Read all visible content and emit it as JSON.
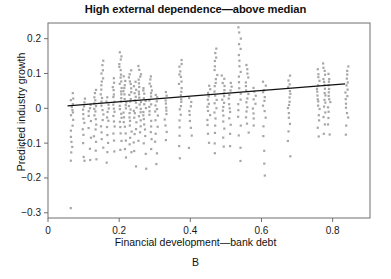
{
  "figure": {
    "title": "High external dependence—above median",
    "panel_label": "B",
    "xlabel": "Financial development—bank debt",
    "ylabel": "Predicted industry growth"
  },
  "chart_data": {
    "type": "scatter",
    "title": "High external dependence—above median",
    "xlabel": "Financial development—bank debt",
    "ylabel": "Predicted industry growth",
    "panel_label": "B",
    "xlim": [
      0.0,
      0.905
    ],
    "ylim": [
      -0.315,
      0.245
    ],
    "xticks": [
      0,
      0.2,
      0.4,
      0.6,
      0.8
    ],
    "xticklabels": [
      "0",
      "0.2",
      "0.4",
      "0.6",
      "0.8"
    ],
    "yticks": [
      0.2,
      0.1,
      0,
      -0.1,
      -0.2,
      -0.3
    ],
    "yticklabels": [
      "0.2",
      "0.1",
      "0",
      "−0.1",
      "−0.2",
      "−0.3"
    ],
    "grid": false,
    "legend": null,
    "marker_color": "#9a9a9a",
    "marker_size": 2.2,
    "fit_line": {
      "color": "#111111",
      "width": 1.2,
      "x_start": 0.055,
      "y_start": 0.007,
      "x_end": 0.835,
      "y_end": 0.07,
      "slope": 0.081,
      "intercept": 0.0025
    },
    "columns": [
      {
        "x": 0.068,
        "values": [
          0.045,
          0.03,
          0.022,
          0.012,
          0.004,
          -0.004,
          -0.012,
          -0.022,
          -0.034,
          -0.05,
          -0.065,
          -0.08,
          -0.095,
          -0.11,
          -0.126,
          -0.152,
          -0.288
        ]
      },
      {
        "x": 0.1,
        "values": [
          0.03,
          0.018,
          0.006,
          -0.004,
          -0.016,
          -0.028,
          -0.042,
          -0.058,
          -0.076,
          -0.1,
          -0.14,
          -0.152
        ]
      },
      {
        "x": 0.118,
        "values": [
          0.012,
          0.002,
          -0.01,
          -0.022,
          -0.038,
          -0.058,
          -0.085,
          -0.118,
          -0.15
        ]
      },
      {
        "x": 0.133,
        "values": [
          0.055,
          0.042,
          0.032,
          0.022,
          0.014,
          0.006,
          -0.002,
          -0.01,
          -0.02,
          -0.032,
          -0.046,
          -0.062,
          -0.08,
          -0.098,
          -0.12,
          -0.145
        ]
      },
      {
        "x": 0.152,
        "values": [
          0.135,
          0.122,
          0.11,
          0.098,
          0.086,
          0.075,
          0.064,
          0.054,
          0.042,
          0.03,
          0.018,
          0.006,
          -0.006,
          -0.018,
          -0.034,
          -0.052,
          -0.07,
          -0.09,
          -0.112
        ]
      },
      {
        "x": 0.168,
        "values": [
          0.03,
          0.018,
          0.008,
          -0.002,
          -0.012,
          -0.024,
          -0.038,
          -0.055,
          -0.075,
          -0.1,
          -0.125,
          -0.158
        ]
      },
      {
        "x": 0.186,
        "values": [
          0.085,
          0.072,
          0.06,
          0.05,
          0.04,
          0.03,
          0.02,
          0.01,
          0.0,
          -0.01,
          -0.022,
          -0.036,
          -0.052,
          -0.072,
          -0.095,
          -0.124
        ]
      },
      {
        "x": 0.203,
        "values": [
          0.16,
          0.148,
          0.138,
          0.128,
          0.118,
          0.108,
          0.098,
          0.088,
          0.078,
          0.068,
          0.058,
          0.048,
          0.038,
          0.028,
          0.018,
          0.008,
          -0.002,
          -0.014,
          -0.026,
          -0.04,
          -0.056,
          -0.074,
          -0.094,
          -0.118
        ]
      },
      {
        "x": 0.216,
        "values": [
          0.09,
          0.078,
          0.068,
          0.058,
          0.048,
          0.038,
          0.028,
          0.018,
          0.008,
          -0.002,
          -0.012,
          -0.024,
          -0.038,
          -0.054,
          -0.072,
          -0.092,
          -0.115,
          -0.14
        ]
      },
      {
        "x": 0.231,
        "values": [
          0.108,
          0.098,
          0.088,
          0.078,
          0.068,
          0.058,
          0.048,
          0.038,
          0.028,
          0.018,
          0.008,
          -0.002,
          -0.012,
          -0.024,
          -0.036,
          -0.05,
          -0.066,
          -0.084,
          -0.104,
          -0.128
        ]
      },
      {
        "x": 0.245,
        "values": [
          0.075,
          0.064,
          0.054,
          0.044,
          0.034,
          0.024,
          0.014,
          0.004,
          -0.006,
          -0.016,
          -0.028,
          -0.042,
          -0.058,
          -0.076,
          -0.098,
          -0.124,
          -0.165
        ]
      },
      {
        "x": 0.258,
        "values": [
          0.12,
          0.11,
          0.1,
          0.09,
          0.08,
          0.07,
          0.06,
          0.05,
          0.04,
          0.03,
          0.02,
          0.01,
          0.0,
          -0.01,
          -0.022,
          -0.036,
          -0.052,
          -0.07,
          -0.092
        ]
      },
      {
        "x": 0.272,
        "values": [
          0.06,
          0.05,
          0.04,
          0.03,
          0.02,
          0.01,
          0.0,
          -0.01,
          -0.02,
          -0.032,
          -0.046,
          -0.062,
          -0.08,
          -0.102,
          -0.13,
          -0.172
        ]
      },
      {
        "x": 0.288,
        "values": [
          0.092,
          0.082,
          0.072,
          0.062,
          0.052,
          0.042,
          0.032,
          0.022,
          0.012,
          0.002,
          -0.008,
          -0.02,
          -0.034,
          -0.05,
          -0.068,
          -0.09,
          -0.118
        ]
      },
      {
        "x": 0.305,
        "values": [
          0.04,
          0.03,
          0.02,
          0.01,
          0.0,
          -0.01,
          -0.022,
          -0.036,
          -0.052,
          -0.072,
          -0.096,
          -0.128,
          -0.16
        ]
      },
      {
        "x": 0.33,
        "values": [
          0.045,
          0.034,
          0.024,
          0.014,
          0.004,
          -0.006,
          -0.018,
          -0.032,
          -0.048,
          -0.068,
          -0.092
        ]
      },
      {
        "x": 0.372,
        "values": [
          0.14,
          0.128,
          0.118,
          0.108,
          0.098,
          0.088,
          0.078,
          0.068,
          0.058,
          0.048,
          0.038,
          0.028,
          0.018,
          0.008,
          -0.004,
          -0.018,
          -0.034,
          -0.054,
          -0.078,
          -0.108,
          -0.145
        ]
      },
      {
        "x": 0.4,
        "values": [
          0.03,
          0.018,
          0.006,
          -0.006,
          -0.02,
          -0.036,
          -0.056,
          -0.08,
          -0.112
        ]
      },
      {
        "x": 0.452,
        "values": [
          0.065,
          0.054,
          0.044,
          0.034,
          0.024,
          0.014,
          0.004,
          -0.006,
          -0.018,
          -0.032,
          -0.05,
          -0.072,
          -0.1
        ]
      },
      {
        "x": 0.472,
        "values": [
          0.17,
          0.158,
          0.146,
          0.134,
          0.122,
          0.11,
          0.098,
          0.086,
          0.074,
          0.062,
          0.05,
          0.038,
          0.026,
          0.014,
          0.002,
          -0.012,
          -0.028,
          -0.048,
          -0.072,
          -0.1,
          -0.13
        ]
      },
      {
        "x": 0.492,
        "values": [
          0.095,
          0.084,
          0.074,
          0.064,
          0.054,
          0.044,
          0.034,
          0.024,
          0.014,
          0.004,
          -0.008,
          -0.022,
          -0.038,
          -0.058,
          -0.082,
          -0.112
        ]
      },
      {
        "x": 0.512,
        "values": [
          0.075,
          0.062,
          0.05,
          0.038,
          0.026,
          0.014,
          0.002,
          -0.012,
          -0.028,
          -0.048,
          -0.074,
          -0.108
        ]
      },
      {
        "x": 0.538,
        "values": [
          0.233,
          0.218,
          0.202,
          0.186,
          0.17,
          0.154,
          0.138,
          0.122,
          0.106,
          0.09,
          0.074,
          0.058,
          0.042,
          0.026,
          0.01,
          -0.006,
          -0.026,
          -0.05,
          -0.078,
          -0.112,
          -0.15
        ]
      },
      {
        "x": 0.56,
        "values": [
          0.125,
          0.112,
          0.1,
          0.088,
          0.076,
          0.064,
          0.052,
          0.04,
          0.028,
          0.016,
          0.004,
          -0.01,
          -0.026,
          -0.046,
          -0.07
        ]
      },
      {
        "x": 0.58,
        "values": [
          0.06,
          0.048,
          0.036,
          0.024,
          0.012,
          0.0,
          -0.014,
          -0.03,
          -0.05
        ]
      },
      {
        "x": 0.608,
        "values": [
          0.075,
          0.064,
          0.054,
          0.044,
          0.034,
          0.022,
          0.008,
          -0.008,
          -0.028,
          -0.052,
          -0.082,
          -0.12,
          -0.158,
          -0.192
        ]
      },
      {
        "x": 0.678,
        "values": [
          0.092,
          0.08,
          0.07,
          0.06,
          0.05,
          0.04,
          0.03,
          0.02,
          0.01,
          0.0,
          -0.012,
          -0.026,
          -0.044,
          -0.066,
          -0.096,
          -0.138
        ]
      },
      {
        "x": 0.76,
        "values": [
          0.11,
          0.098,
          0.088,
          0.078,
          0.068,
          0.058,
          0.048,
          0.038,
          0.028,
          0.018,
          0.008,
          -0.004,
          -0.018,
          -0.034,
          -0.054,
          -0.08
        ]
      },
      {
        "x": 0.776,
        "values": [
          0.128,
          0.116,
          0.106,
          0.096,
          0.086,
          0.076,
          0.066,
          0.056,
          0.046,
          0.036,
          0.026,
          0.016,
          0.004,
          -0.01,
          -0.026,
          -0.046,
          -0.072
        ]
      },
      {
        "x": 0.79,
        "values": [
          0.098,
          0.086,
          0.076,
          0.066,
          0.056,
          0.046,
          0.036,
          0.026,
          0.016,
          0.004,
          -0.01,
          -0.026,
          -0.046,
          -0.074
        ]
      },
      {
        "x": 0.84,
        "values": [
          0.118,
          0.106,
          0.096,
          0.086,
          0.076,
          0.066,
          0.056,
          0.046,
          0.036,
          0.026,
          0.014,
          0.002,
          -0.012,
          -0.028,
          -0.048,
          -0.074
        ]
      }
    ]
  }
}
